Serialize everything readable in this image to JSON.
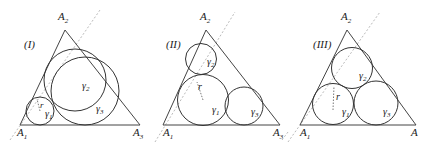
{
  "diagrams": [
    {
      "caption": "(I)",
      "vertices": {
        "A1": "A",
        "A1_sub": "1",
        "A2": "A",
        "A2_sub": "2",
        "A3": "A",
        "A3_sub": "3"
      },
      "circles": [
        {
          "label": "γ",
          "sub": "1"
        },
        {
          "label": "γ",
          "sub": "2"
        },
        {
          "label": "γ",
          "sub": "3"
        }
      ],
      "radius_label": "r"
    },
    {
      "caption": "(II)",
      "vertices": {
        "A1": "A",
        "A1_sub": "1",
        "A2": "A",
        "A2_sub": "2",
        "A3": "A",
        "A3_sub": "3"
      },
      "circles": [
        {
          "label": "γ",
          "sub": "1"
        },
        {
          "label": "γ",
          "sub": "2"
        },
        {
          "label": "γ",
          "sub": "3"
        }
      ],
      "radius_label": "r"
    },
    {
      "caption": "(III)",
      "vertices": {
        "A1": "A",
        "A1_sub": "1",
        "A2": "A",
        "A2_sub": "2",
        "A3": "A",
        "A3_sub": ""
      },
      "circles": [
        {
          "label": "γ",
          "sub": "1"
        },
        {
          "label": "γ",
          "sub": "2"
        },
        {
          "label": "γ",
          "sub": "3"
        }
      ],
      "radius_label": "r"
    }
  ]
}
